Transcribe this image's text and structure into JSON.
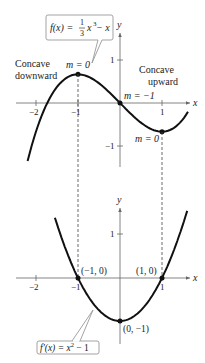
{
  "figure": {
    "top_graph": {
      "function_label": "f(x) = ⅓x³ − x",
      "function_label_parts": {
        "lhs": "f(x) = ",
        "frac_num": "1",
        "frac_den": "3",
        "var": "x",
        "exp": "3",
        "rest": " − x"
      },
      "x_axis_label": "x",
      "y_axis_label": "y",
      "x_ticks": [
        "−2",
        "−1",
        "1"
      ],
      "y_ticks": [
        "1",
        "−1"
      ],
      "annotations": {
        "concave_down_line1": "Concave",
        "concave_down_line2": "downward",
        "concave_up_line1": "Concave",
        "concave_up_line2": "upward",
        "slope_max": "m = 0",
        "slope_inflection": "m = −1",
        "slope_min": "m = 0"
      },
      "points": [
        {
          "x": -1,
          "y": 0.667,
          "label": "m = 0"
        },
        {
          "x": 0,
          "y": 0,
          "label": "m = −1"
        },
        {
          "x": 1,
          "y": -0.667,
          "label": "m = 0"
        }
      ]
    },
    "bottom_graph": {
      "function_label": "f′(x) = x² − 1",
      "function_label_parts": {
        "lhs": "f′(x) = x",
        "exp": "2",
        "rest": " − 1"
      },
      "x_axis_label": "x",
      "y_axis_label": "y",
      "x_ticks": [
        "−2",
        "−1",
        "1"
      ],
      "y_ticks": [
        "1"
      ],
      "points": [
        {
          "x": -1,
          "y": 0,
          "label": "(−1, 0)"
        },
        {
          "x": 1,
          "y": 0,
          "label": "(1, 0)"
        },
        {
          "x": 0,
          "y": -1,
          "label": "(0, −1)"
        }
      ]
    },
    "colors": {
      "curve": "#111111",
      "axis": "#555555",
      "callout_border": "#aaaaaa",
      "text": "#222222"
    }
  }
}
